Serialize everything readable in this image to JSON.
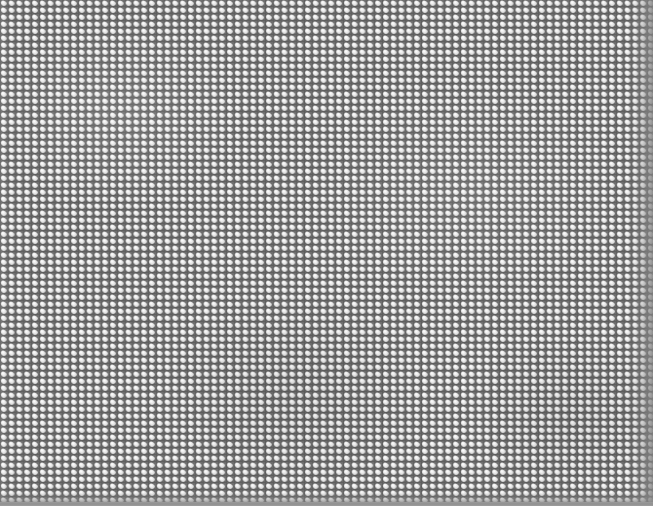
{
  "image": {
    "kind": "texture-pattern",
    "subject": "woven metal mesh / perforated bead grid",
    "width_px": 653,
    "height_px": 506,
    "has_text": false,
    "visible_text": ""
  },
  "pattern": {
    "name": "bead-grid-mesh",
    "shape": "rounded-square",
    "cell_pitch_x_px": 7.8,
    "cell_pitch_y_px": 7.0,
    "columns_approx": 84,
    "rows_approx": 72,
    "alignment": "orthogonal-grid",
    "repeat": "both-axes"
  },
  "colors": {
    "bead_highlight": "#ffffff",
    "bead_face": "#ededed",
    "bead_midtone": "#e2e2e2",
    "bead_shade": "#c9c9c9",
    "grid_line": "#555555",
    "grid_line_soft": "#6b6b6b",
    "base": "#6f6f6f",
    "edge_shadow": "#808080",
    "bottom_band": "#909090",
    "page_background": "#ffffff"
  },
  "lighting": {
    "highlight_origin": "upper-left",
    "right_edge_shadow_px": 22,
    "bottom_edge_shadow_px": 14,
    "bottom_band_px": 4,
    "top_edge_shadow_px": 0,
    "left_edge_shadow_px": 0
  }
}
